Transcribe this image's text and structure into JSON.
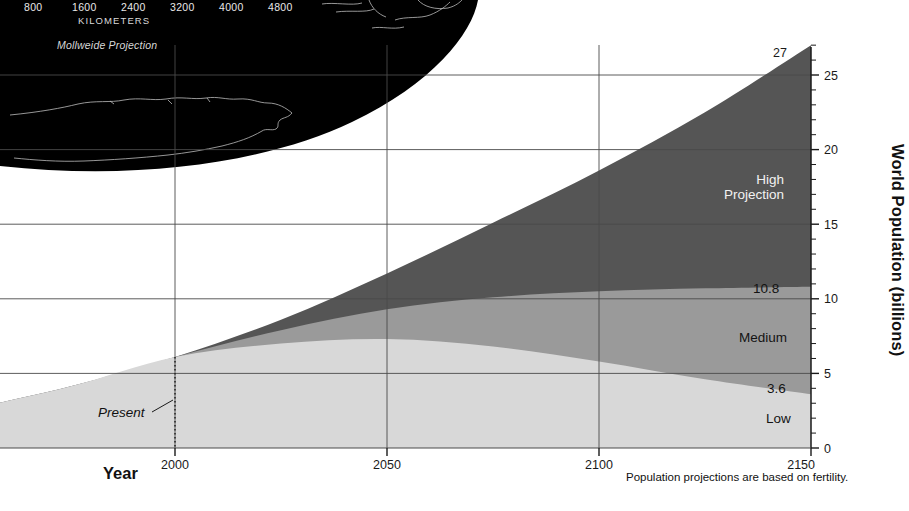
{
  "map": {
    "scale_values": [
      "800",
      "1600",
      "2400",
      "3200",
      "4000",
      "4800"
    ],
    "scale_unit": "KILOMETERS",
    "projection": "Mollweide Projection"
  },
  "chart_data": {
    "type": "area",
    "title": "",
    "xlabel": "Year",
    "ylabel": "World Population (billions)",
    "xlim": [
      1950,
      2150
    ],
    "ylim": [
      0,
      27.5
    ],
    "x_ticks": [
      2000,
      2050,
      2100,
      2150
    ],
    "y_ticks": [
      0,
      5,
      10,
      15,
      20,
      25
    ],
    "y_minor_tick_step": 1,
    "grid": true,
    "legend_position": "in-plot",
    "footnote": "Population projections are based on fertility.",
    "present_marker": {
      "label": "Present",
      "year": 2000
    },
    "endpoint_labels": [
      {
        "text": "27",
        "series": "High",
        "value": 27.0
      },
      {
        "text": "10.8",
        "series": "Medium",
        "value": 10.8
      },
      {
        "text": "3.6",
        "series": "Low",
        "value": 3.6
      }
    ],
    "series": [
      {
        "name": "High Projection",
        "label": "High\nProjection",
        "color": "#555555",
        "x": [
          1950,
          1975,
          2000,
          2025,
          2050,
          2075,
          2100,
          2125,
          2150
        ],
        "values": [
          2.5,
          4.1,
          6.1,
          8.6,
          11.7,
          15.1,
          18.6,
          22.5,
          27.0
        ]
      },
      {
        "name": "Medium",
        "label": "Medium",
        "color": "#9a9a9a",
        "x": [
          1950,
          1975,
          2000,
          2025,
          2050,
          2075,
          2100,
          2125,
          2150
        ],
        "values": [
          2.5,
          4.1,
          6.1,
          7.9,
          9.3,
          10.1,
          10.5,
          10.7,
          10.8
        ]
      },
      {
        "name": "Low",
        "label": "Low",
        "color": "#d8d8d8",
        "x": [
          1950,
          1975,
          2000,
          2025,
          2050,
          2075,
          2100,
          2125,
          2150
        ],
        "values": [
          2.5,
          4.1,
          6.1,
          7.0,
          7.3,
          6.8,
          5.8,
          4.6,
          3.6
        ]
      }
    ]
  }
}
